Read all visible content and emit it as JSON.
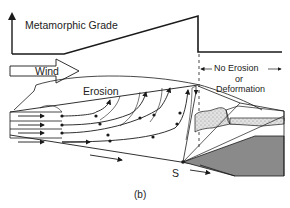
{
  "figure": {
    "panel_label": "(b)",
    "graph": {
      "y_axis_label": "Metamorphic Grade"
    },
    "labels": {
      "wind": "Wind",
      "erosion": "Erosion",
      "no_erosion_line1": "No Erosion",
      "no_erosion_line2": "or",
      "no_erosion_line3": "Deformation",
      "point_s": "S"
    },
    "colors": {
      "line": "#1a1a1a",
      "stipple_fill": "#dcdcdc",
      "dark_fill": "#8a8a8a",
      "background": "#ffffff"
    }
  }
}
